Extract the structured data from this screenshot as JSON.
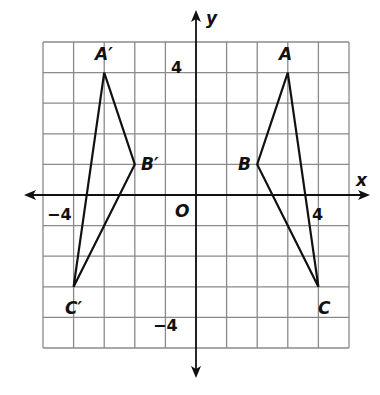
{
  "diagram": {
    "type": "coordinate-plane",
    "grid": {
      "xmin": -5,
      "xmax": 5,
      "ymin": -5,
      "ymax": 5,
      "step": 1
    },
    "axes": {
      "x_label": "x",
      "y_label": "y",
      "origin_label": "O"
    },
    "tick_labels": {
      "x_pos": "4",
      "x_neg": "−4",
      "y_pos": "4",
      "y_neg": "−4"
    },
    "triangles": [
      {
        "name": "ABC",
        "vertices": [
          {
            "label": "A",
            "x": 3,
            "y": 4
          },
          {
            "label": "B",
            "x": 2,
            "y": 1
          },
          {
            "label": "C",
            "x": 4,
            "y": -3
          }
        ]
      },
      {
        "name": "A'B'C'",
        "vertices": [
          {
            "label": "A′",
            "x": -3,
            "y": 4
          },
          {
            "label": "B′",
            "x": -2,
            "y": 1
          },
          {
            "label": "C′",
            "x": -4,
            "y": -3
          }
        ]
      }
    ],
    "colors": {
      "grid": "#8a8a8a",
      "axes": "#111111",
      "triangle": "#111111",
      "background": "#ffffff"
    }
  }
}
